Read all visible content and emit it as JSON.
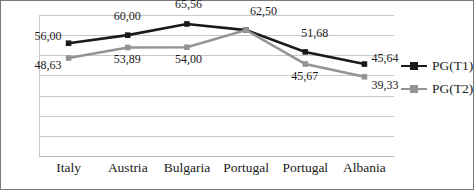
{
  "chart_data": {
    "type": "line",
    "title": "",
    "xlabel": "",
    "ylabel": "",
    "categories": [
      "Italy",
      "Austria",
      "Bulgaria",
      "Portugal",
      "Portugal",
      "Albania"
    ],
    "series": [
      {
        "name": "PG(T1)",
        "color": "#1a1a1a",
        "values": [
          56.0,
          60.0,
          65.56,
          62.5,
          51.68,
          45.64
        ],
        "labels": [
          "56,00",
          "60,00",
          "65,56",
          "62,50",
          "51,68",
          "45,64"
        ]
      },
      {
        "name": "PG(T2)",
        "color": "#949494",
        "values": [
          48.63,
          53.89,
          54.0,
          62.5,
          45.67,
          39.33
        ],
        "labels": [
          "48,63",
          "53,89",
          "54,00",
          "62,50",
          "45,67",
          "39,33"
        ]
      }
    ],
    "ylim": [
      0,
      70
    ],
    "ytick_step": 10,
    "yticks": [
      "70",
      "60",
      "50",
      "40",
      "30",
      "20",
      "10",
      "0"
    ],
    "grid": true,
    "legend_position": "right",
    "marker": "square",
    "decimal_separator": ","
  },
  "legend": {
    "items": [
      {
        "label": "PG(T1)",
        "color": "#1a1a1a"
      },
      {
        "label": "PG(T2)",
        "color": "#949494"
      }
    ]
  },
  "colors": {
    "series1": "#1a1a1a",
    "series2": "#949494",
    "grid": "#c9c9c9",
    "border": "#7a7a7a",
    "background": "#ffffff",
    "text": "#1a1a1a"
  }
}
